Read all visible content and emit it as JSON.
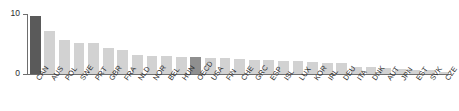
{
  "chart_data": {
    "type": "bar",
    "title": "",
    "subtitle": "",
    "xlabel": "",
    "ylabel": "",
    "ylim": [
      0,
      10
    ],
    "yticks": [
      0,
      10
    ],
    "ytick_labels": [
      "0",
      "10"
    ],
    "grid": false,
    "legend": null,
    "orientation": "vertical",
    "highlight_color": "#5a5a5a",
    "secondary_highlight_color": "#8f8f8f",
    "bar_color": "#d2d2d2",
    "axis_color": "#6e6e6e",
    "categories": [
      "CAN",
      "AUS",
      "POL",
      "SWE",
      "PRT",
      "GBR",
      "FRA",
      "NLD",
      "NOR",
      "BEL",
      "HUN",
      "OECD",
      "USA",
      "FIN",
      "CHE",
      "GRC",
      "ESP",
      "ISL",
      "LUX",
      "KOR",
      "IRL",
      "DEU",
      "ITA",
      "DNK",
      "AUT",
      "JPN",
      "EST",
      "SVK",
      "CZE"
    ],
    "values": [
      9.7,
      7.1,
      5.6,
      5.2,
      5.2,
      4.3,
      4.0,
      3.1,
      3.0,
      3.0,
      2.9,
      2.8,
      2.7,
      2.6,
      2.5,
      2.4,
      2.3,
      2.2,
      2.1,
      2.0,
      1.9,
      1.8,
      1.2,
      1.1,
      1.0,
      0.8,
      0.7,
      0.6,
      0.4
    ],
    "highlighted": [
      "CAN",
      "OECD"
    ]
  }
}
